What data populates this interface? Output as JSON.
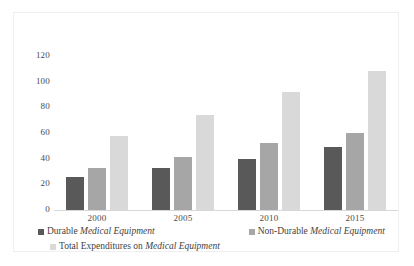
{
  "chart_data": {
    "type": "bar",
    "title": "",
    "xlabel": "",
    "ylabel": "",
    "categories": [
      "2000",
      "2005",
      "2010",
      "2015"
    ],
    "ylim": [
      0,
      120
    ],
    "yticks": [
      "0",
      "20",
      "40",
      "60",
      "80",
      "100",
      "120"
    ],
    "grid": false,
    "legend_position": "bottom",
    "series": [
      {
        "name": "Durable Medical Equipment",
        "name_plain": "Durable ",
        "name_italic": "Medical Equipment",
        "color": "#595959",
        "values": [
          26,
          33,
          40,
          49
        ]
      },
      {
        "name": "Non-Durable Medical Equipment",
        "name_plain": "Non-Durable ",
        "name_italic": "Medical Equipment",
        "color": "#a6a6a6",
        "values": [
          33,
          41,
          52,
          60
        ]
      },
      {
        "name": "Total Expenditures on Medical Equipment",
        "name_plain": "Total Expenditures on ",
        "name_italic": "Medical Equipment",
        "color": "#d9d9d9",
        "values": [
          58,
          74,
          92,
          108
        ]
      }
    ]
  }
}
